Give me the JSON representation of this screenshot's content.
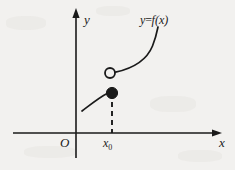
{
  "figure": {
    "background_color": "#f2f1ef",
    "ink_color": "#1a1a1a",
    "axes": {
      "x_axis_label": "x",
      "y_axis_label": "y",
      "origin_label": "O",
      "x_axis": {
        "x_start": 13,
        "x_end": 222,
        "y": 133
      },
      "y_axis": {
        "x": 76,
        "y_start": 8,
        "y_end": 158
      }
    },
    "marks": {
      "x0_label": "x₀",
      "x0_label_text": "x",
      "x0_subscript": "0",
      "x0_position_px": 112,
      "dashed_line": {
        "x": 112,
        "y_top": 93,
        "y_bottom": 133,
        "style": "dashed"
      },
      "open_circle": {
        "cx": 110,
        "cy": 73,
        "r": 5,
        "fill": "#f2f1ef",
        "meaning": "limit-value-not-attained"
      },
      "filled_circle": {
        "cx": 112,
        "cy": 93,
        "r": 5.5,
        "fill": "#1a1a1a",
        "meaning": "function-value-at-x0"
      }
    },
    "curve_label": "y=f(x)",
    "curve_label_parts": {
      "y": "y",
      "equals": "=",
      "f": "f",
      "argument": "(x)"
    },
    "left_branch": {
      "from_px": [
        82,
        111
      ],
      "to_px": [
        107,
        93
      ],
      "shape": "concave-down-increasing"
    },
    "right_branch": {
      "from_px": [
        115,
        72
      ],
      "to_px": [
        158,
        27
      ],
      "shape": "concave-up-increasing"
    }
  }
}
